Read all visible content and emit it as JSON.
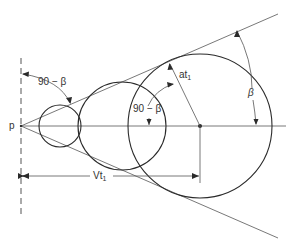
{
  "diagram": {
    "labels": {
      "point": "p",
      "angle_left": "90 − β",
      "angle_center": "90 − β",
      "at_main": "at",
      "at_sub": "1",
      "beta": "β",
      "vt_main": "Vt",
      "vt_sub": "1"
    },
    "colors": {
      "stroke": "#2a2a2a",
      "thin": "#555555",
      "background": "#ffffff"
    }
  }
}
